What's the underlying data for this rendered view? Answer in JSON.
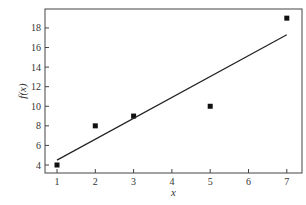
{
  "chart_data": {
    "type": "scatter",
    "title": "",
    "xlabel": "x",
    "ylabel": "f(x)",
    "xlim": [
      0.7,
      7.4
    ],
    "ylim": [
      3.2,
      19.7
    ],
    "xticks": [
      1,
      2,
      3,
      4,
      5,
      6,
      7
    ],
    "yticks": [
      4,
      6,
      8,
      10,
      12,
      14,
      16,
      18
    ],
    "grid": false,
    "legend": null,
    "series": [
      {
        "name": "data points",
        "type": "scatter",
        "marker": "square",
        "x": [
          1,
          2,
          3,
          5,
          7
        ],
        "y": [
          4,
          8,
          9,
          10,
          19
        ]
      },
      {
        "name": "linear fit",
        "type": "line",
        "x": [
          1,
          7
        ],
        "y": [
          4.5,
          17.3
        ]
      }
    ]
  }
}
